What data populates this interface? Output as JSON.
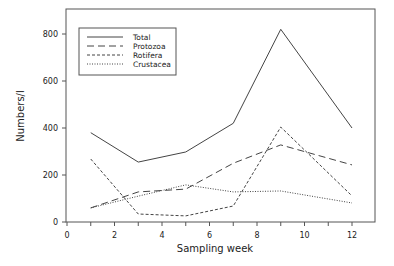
{
  "chart_data": {
    "type": "line",
    "title": "",
    "xlabel": "Sampling week",
    "ylabel": "Numbers/l",
    "xlim": [
      0,
      12
    ],
    "ylim": [
      0,
      900
    ],
    "x_ticks": [
      0,
      2,
      4,
      6,
      8,
      10,
      12
    ],
    "x_minor_ticks": [
      1,
      3,
      5,
      7,
      9,
      11
    ],
    "y_ticks": [
      0,
      200,
      400,
      600,
      800
    ],
    "grid": false,
    "legend_position": "upper-left",
    "x": [
      1,
      3,
      5,
      7,
      9,
      12
    ],
    "series": [
      {
        "name": "Total",
        "style": "solid",
        "values": [
          380,
          255,
          298,
          420,
          820,
          400
        ]
      },
      {
        "name": "Protozoa",
        "style": "long-dash",
        "values": [
          60,
          128,
          140,
          250,
          328,
          243
        ]
      },
      {
        "name": "Rotifera",
        "style": "short-dash",
        "values": [
          268,
          34,
          26,
          68,
          404,
          111
        ]
      },
      {
        "name": "Crustacea",
        "style": "dotted",
        "values": [
          60,
          110,
          158,
          128,
          132,
          81
        ]
      }
    ]
  }
}
